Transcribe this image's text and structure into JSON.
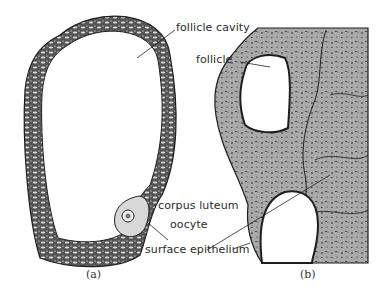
{
  "figure": {
    "panels": [
      {
        "id": "a",
        "caption": "(a)"
      },
      {
        "id": "b",
        "caption": "(b)"
      }
    ],
    "labels": {
      "follicle_cavity": "follicle cavity",
      "follicle": "follicle",
      "corpus_luteum": "corpus luteum",
      "oocyte": "oocyte",
      "surface_epithelium": "surface epithelium"
    },
    "colors": {
      "tissue_gray": "#a9a9a9",
      "outline": "#1e1e1e",
      "background": "#ffffff"
    }
  }
}
